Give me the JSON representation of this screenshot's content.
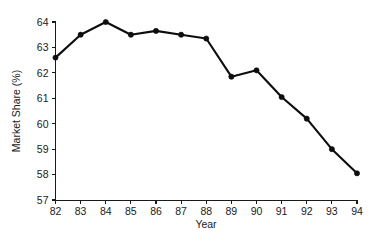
{
  "chart_data": {
    "type": "line",
    "title": "",
    "subtitle": "",
    "xlabel": "Year",
    "ylabel": "Market Share (%)",
    "categories": [
      "82",
      "83",
      "84",
      "85",
      "86",
      "87",
      "88",
      "89",
      "90",
      "91",
      "92",
      "93",
      "94"
    ],
    "x": [
      82,
      83,
      84,
      85,
      86,
      87,
      88,
      89,
      90,
      91,
      92,
      93,
      94
    ],
    "values": [
      62.6,
      63.5,
      64.0,
      63.5,
      63.65,
      63.5,
      63.35,
      61.85,
      62.1,
      61.05,
      60.2,
      59.0,
      58.05
    ],
    "series": [
      {
        "name": "Market Share",
        "values": [
          62.6,
          63.5,
          64.0,
          63.5,
          63.65,
          63.5,
          63.35,
          61.85,
          62.1,
          61.05,
          60.2,
          59.0,
          58.05
        ]
      }
    ],
    "xlim": [
      82,
      94
    ],
    "ylim": [
      57,
      64
    ],
    "yticks": [
      57,
      58,
      59,
      60,
      61,
      62,
      63,
      64
    ],
    "ytick_labels": [
      "57",
      "58",
      "59",
      "60",
      "61",
      "62",
      "63",
      "64"
    ],
    "xticks": [
      82,
      83,
      84,
      85,
      86,
      87,
      88,
      89,
      90,
      91,
      92,
      93,
      94
    ],
    "xtick_labels": [
      "82",
      "83",
      "84",
      "85",
      "86",
      "87",
      "88",
      "89",
      "90",
      "91",
      "92",
      "93",
      "94"
    ],
    "grid": false,
    "legend": false,
    "legend_position": "none",
    "marker": "filled-circle",
    "line_color": "#0d0d0d",
    "marker_color": "#0d0d0d",
    "axis_color": "#1a1a1a",
    "background_color": "#ffffff",
    "annotations": []
  }
}
